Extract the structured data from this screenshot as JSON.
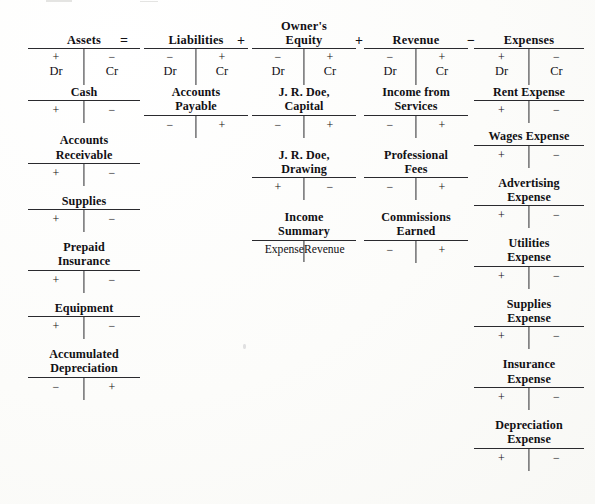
{
  "diagram": {
    "operators": {
      "equals": "=",
      "plus": "+",
      "minus": "−"
    },
    "signs": {
      "plus": "+",
      "minus": "−"
    },
    "debit_label": "Dr",
    "credit_label": "Cr",
    "ink_color": "#111014",
    "rule_color": "#2a2a2e",
    "paper_color": "#fdfdfb"
  },
  "groups": [
    {
      "id": "assets",
      "header": {
        "line1": "Assets",
        "line2": ""
      },
      "operator_before": "",
      "dr_sign": "+",
      "cr_sign": "−",
      "accounts": [
        {
          "line1": "Cash",
          "line2": "",
          "left": "+",
          "right": "−"
        },
        {
          "line1": "Accounts",
          "line2": "Receivable",
          "left": "+",
          "right": "−"
        },
        {
          "line1": "Supplies",
          "line2": "",
          "left": "+",
          "right": "−"
        },
        {
          "line1": "Prepaid",
          "line2": "Insurance",
          "left": "+",
          "right": "−"
        },
        {
          "line1": "Equipment",
          "line2": "",
          "left": "+",
          "right": "−"
        },
        {
          "line1": "Accumulated",
          "line2": "Depreciation",
          "left": "−",
          "right": "+"
        }
      ]
    },
    {
      "id": "liabilities",
      "header": {
        "line1": "Liabilities",
        "line2": ""
      },
      "operator_before": "=",
      "dr_sign": "−",
      "cr_sign": "+",
      "accounts": [
        {
          "line1": "Accounts",
          "line2": "Payable",
          "left": "−",
          "right": "+"
        }
      ]
    },
    {
      "id": "owners-equity",
      "header": {
        "line1": "Owner's",
        "line2": "Equity"
      },
      "operator_before": "+",
      "dr_sign": "−",
      "cr_sign": "+",
      "accounts": [
        {
          "line1": "J. R. Doe,",
          "line2": "Capital",
          "left": "−",
          "right": "+"
        },
        {
          "line1": "J. R. Doe,",
          "line2": "Drawing",
          "left": "+",
          "right": "−"
        },
        {
          "line1": "Income",
          "line2": "Summary",
          "left": "Expense",
          "right": "Revenue",
          "words": true
        }
      ]
    },
    {
      "id": "revenue",
      "header": {
        "line1": "Revenue",
        "line2": ""
      },
      "operator_before": "+",
      "dr_sign": "−",
      "cr_sign": "+",
      "accounts": [
        {
          "line1": "Income from",
          "line2": "Services",
          "left": "−",
          "right": "+"
        },
        {
          "line1": "Professional",
          "line2": "Fees",
          "left": "−",
          "right": "+"
        },
        {
          "line1": "Commissions",
          "line2": "Earned",
          "left": "−",
          "right": "+"
        }
      ]
    },
    {
      "id": "expenses",
      "header": {
        "line1": "Expenses",
        "line2": ""
      },
      "operator_before": "−",
      "dr_sign": "+",
      "cr_sign": "−",
      "accounts": [
        {
          "line1": "Rent Expense",
          "line2": "",
          "left": "+",
          "right": "−"
        },
        {
          "line1": "Wages Expense",
          "line2": "",
          "left": "+",
          "right": "−"
        },
        {
          "line1": "Advertising",
          "line2": "Expense",
          "left": "+",
          "right": "−"
        },
        {
          "line1": "Utilities",
          "line2": "Expense",
          "left": "+",
          "right": "−"
        },
        {
          "line1": "Supplies",
          "line2": "Expense",
          "left": "+",
          "right": "−"
        },
        {
          "line1": "Insurance",
          "line2": "Expense",
          "left": "+",
          "right": "−"
        },
        {
          "line1": "Depreciation",
          "line2": "Expense",
          "left": "+",
          "right": "−"
        }
      ]
    }
  ]
}
